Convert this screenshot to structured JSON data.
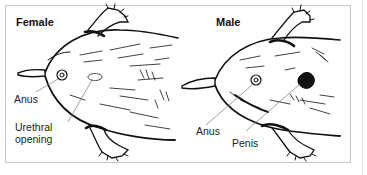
{
  "panels": [
    {
      "title": "Female",
      "labels": [
        {
          "text": "Anus"
        },
        {
          "text": "Urethral opening",
          "line1": "Urethral",
          "line2": "opening"
        }
      ]
    },
    {
      "title": "Male",
      "labels": [
        {
          "text": "Anus"
        },
        {
          "text": "Penis"
        }
      ]
    }
  ],
  "colors": {
    "ink": "#111111",
    "leader": "#777777",
    "border": "#c8c8c8"
  }
}
